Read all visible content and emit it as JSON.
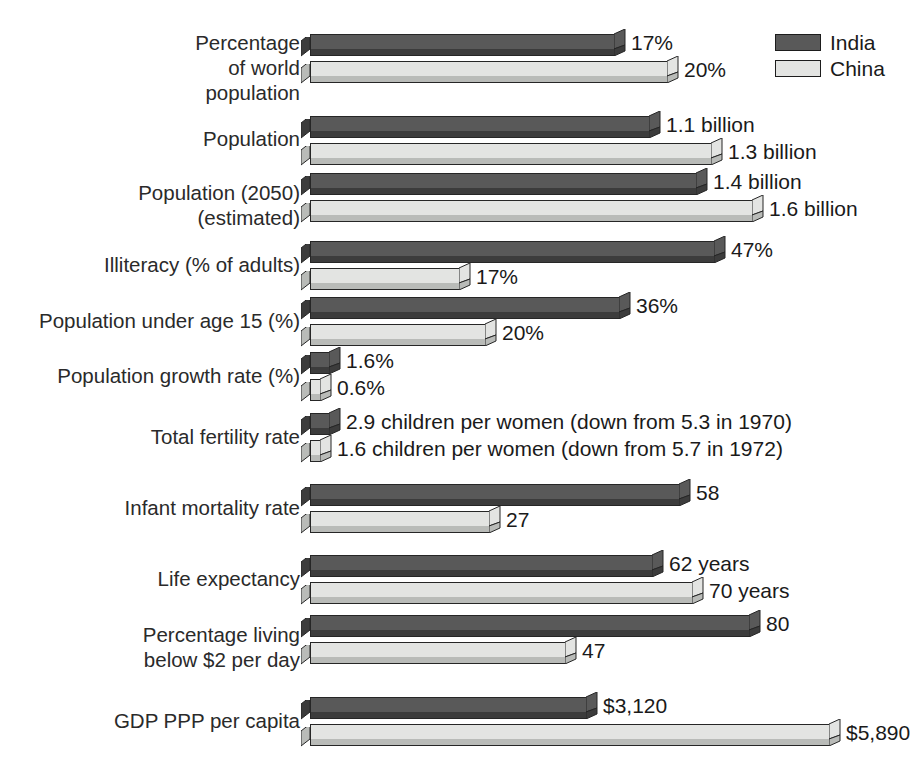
{
  "legend": {
    "entries": [
      {
        "label": "India",
        "color": "#595959",
        "key": "india"
      },
      {
        "label": "China",
        "color": "#e3e4e2",
        "key": "china"
      }
    ]
  },
  "colors": {
    "india_top": "#595959",
    "india_base": "#3c3c3c",
    "china_top": "#e3e4e2",
    "china_base": "#b9bbb8",
    "outline": "#262626",
    "text": "#1a1a1a",
    "background": "#ffffff"
  },
  "chart_data": {
    "type": "bar",
    "orientation": "horizontal",
    "title": "",
    "subtitle": "",
    "xlabel": "",
    "ylabel": "",
    "grid": false,
    "legend_position": "top-right",
    "series_names": [
      "India",
      "China"
    ],
    "note": "Each indicator row is independently scaled; bar lengths are proportional within a row only.",
    "categories": [
      "Percentage of world population",
      "Population",
      "Population (2050) (estimated)",
      "Illiteracy (% of adults)",
      "Population under age 15 (%)",
      "Population growth rate (%)",
      "Total fertility rate",
      "Infant mortality rate",
      "Life expectancy",
      "Percentage living below $2 per day",
      "GDP PPP per capita"
    ],
    "series": [
      {
        "name": "India",
        "values": [
          17,
          1.1,
          1.4,
          47,
          36,
          1.6,
          2.9,
          58,
          62,
          80,
          3120
        ]
      },
      {
        "name": "China",
        "values": [
          20,
          1.3,
          1.6,
          17,
          20,
          0.6,
          1.6,
          27,
          70,
          47,
          5890
        ]
      }
    ]
  },
  "rows": [
    {
      "label": "Percentage\nof world\npopulation",
      "label_top": 30,
      "label_lines": 3,
      "bars_top": 34,
      "india": {
        "value": 17,
        "text": "17%",
        "length": 305
      },
      "china": {
        "value": 20,
        "text": "20%",
        "length": 358
      }
    },
    {
      "label": "Population",
      "label_top": 126,
      "label_lines": 1,
      "bars_top": 116,
      "india": {
        "value": 1.1,
        "text": "1.1 billion",
        "length": 340
      },
      "china": {
        "value": 1.3,
        "text": "1.3 billion",
        "length": 402
      }
    },
    {
      "label": "Population (2050)\n(estimated)",
      "label_top": 180,
      "label_lines": 2,
      "bars_top": 173,
      "india": {
        "value": 1.4,
        "text": "1.4 billion",
        "length": 387
      },
      "china": {
        "value": 1.6,
        "text": "1.6 billion",
        "length": 443
      }
    },
    {
      "label": "Illiteracy (% of adults)",
      "label_top": 252,
      "label_lines": 1,
      "bars_top": 241,
      "india": {
        "value": 47,
        "text": "47%",
        "length": 405
      },
      "china": {
        "value": 17,
        "text": "17%",
        "length": 150
      }
    },
    {
      "label": "Population under age 15 (%)",
      "label_top": 308,
      "label_lines": 1,
      "bars_top": 297,
      "india": {
        "value": 36,
        "text": "36%",
        "length": 310
      },
      "china": {
        "value": 20,
        "text": "20%",
        "length": 176
      }
    },
    {
      "label": "Population growth rate (%)",
      "label_top": 363,
      "label_lines": 1,
      "bars_top": 352,
      "india": {
        "value": 1.6,
        "text": "1.6%",
        "length": 20
      },
      "china": {
        "value": 0.6,
        "text": "0.6%",
        "length": 11
      }
    },
    {
      "label": "Total fertility rate",
      "label_top": 424,
      "label_lines": 1,
      "bars_top": 413,
      "india": {
        "value": 2.9,
        "text": "2.9 children per women (down from 5.3 in 1970)",
        "length": 20
      },
      "china": {
        "value": 1.6,
        "text": "1.6 children per women (down from 5.7 in 1972)",
        "length": 11
      }
    },
    {
      "label": "Infant mortality rate",
      "label_top": 495,
      "label_lines": 1,
      "bars_top": 484,
      "india": {
        "value": 58,
        "text": "58",
        "length": 370
      },
      "china": {
        "value": 27,
        "text": "27",
        "length": 180
      }
    },
    {
      "label": "Life expectancy",
      "label_top": 566,
      "label_lines": 1,
      "bars_top": 555,
      "india": {
        "value": 62,
        "text": "62 years",
        "length": 343
      },
      "china": {
        "value": 70,
        "text": "70 years",
        "length": 383
      }
    },
    {
      "label": "Percentage living\nbelow $2 per day",
      "label_top": 622,
      "label_lines": 2,
      "bars_top": 615,
      "india": {
        "value": 80,
        "text": "80",
        "length": 440
      },
      "china": {
        "value": 47,
        "text": "47",
        "length": 256
      }
    },
    {
      "label": "GDP PPP per capita",
      "label_top": 708,
      "label_lines": 1,
      "bars_top": 697,
      "india": {
        "value": 3120,
        "text": "$3,120",
        "length": 277
      },
      "china": {
        "value": 5890,
        "text": "$5,890",
        "length": 520
      }
    }
  ]
}
